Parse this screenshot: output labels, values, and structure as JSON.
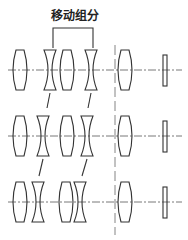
{
  "diagram": {
    "title": "移动组分",
    "type": "zoom lens configuration schematic",
    "rows": [
      {
        "name": "position-1",
        "axis_y": 70,
        "elements": [
          {
            "type": "positive-lens",
            "x": 20
          },
          {
            "type": "negative-lens",
            "x": 50
          },
          {
            "type": "positive-lens",
            "x": 67
          },
          {
            "type": "negative-lens",
            "x": 91
          },
          {
            "type": "positive-lens",
            "x": 125
          },
          {
            "type": "plate",
            "x": 165
          }
        ]
      },
      {
        "name": "position-2",
        "axis_y": 136,
        "elements": [
          {
            "type": "positive-lens",
            "x": 20
          },
          {
            "type": "negative-lens",
            "x": 43
          },
          {
            "type": "positive-lens",
            "x": 67
          },
          {
            "type": "negative-lens",
            "x": 87
          },
          {
            "type": "positive-lens",
            "x": 125
          },
          {
            "type": "plate",
            "x": 165
          }
        ]
      },
      {
        "name": "position-3",
        "axis_y": 202,
        "elements": [
          {
            "type": "positive-lens",
            "x": 20
          },
          {
            "type": "negative-lens",
            "x": 38
          },
          {
            "type": "positive-lens",
            "x": 66
          },
          {
            "type": "negative-lens",
            "x": 80
          },
          {
            "type": "positive-lens",
            "x": 125
          },
          {
            "type": "plate",
            "x": 165
          }
        ]
      }
    ],
    "moving_group_bracket": {
      "x1": 53,
      "x2": 93,
      "y_top": 28
    },
    "stop_line_x": 115,
    "colors": {
      "line": "#333333",
      "background": "#ffffff"
    }
  }
}
